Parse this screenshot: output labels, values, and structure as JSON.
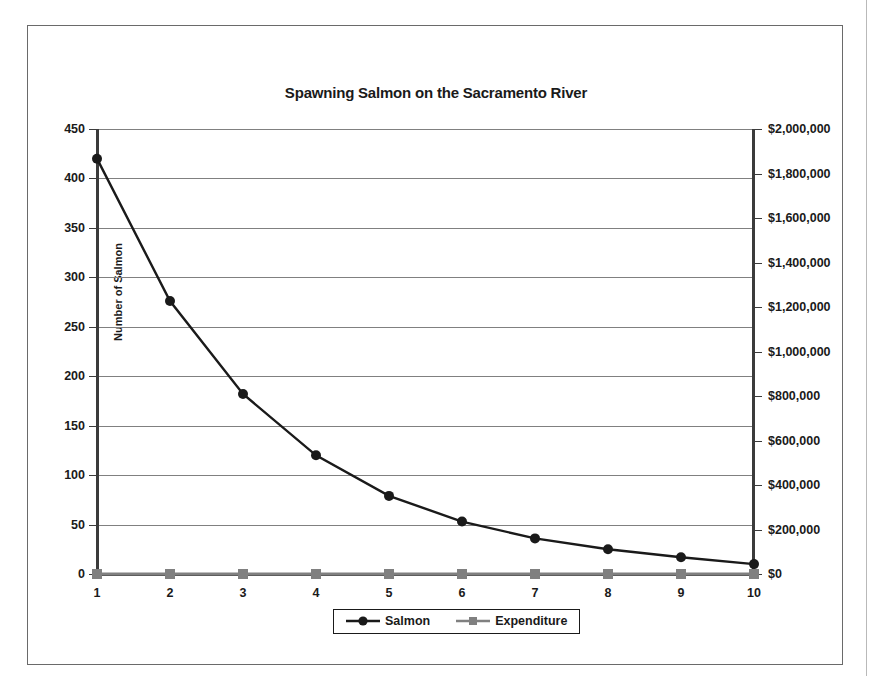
{
  "chart_data": {
    "type": "line",
    "title": "Spawning Salmon on the Sacramento River",
    "xlabel": "Year",
    "ylabel": "Number of Salmon",
    "y2label": "",
    "grid": true,
    "legend_position": "bottom",
    "categories": [
      "1",
      "2",
      "3",
      "4",
      "5",
      "6",
      "7",
      "8",
      "9",
      "10"
    ],
    "x": [
      1,
      2,
      3,
      4,
      5,
      6,
      7,
      8,
      9,
      10
    ],
    "ylim": [
      0,
      450
    ],
    "y2lim": [
      0,
      2000000
    ],
    "yticks": [
      "0",
      "50",
      "100",
      "150",
      "200",
      "250",
      "300",
      "350",
      "400",
      "450"
    ],
    "ytick_values": [
      0,
      50,
      100,
      150,
      200,
      250,
      300,
      350,
      400,
      450
    ],
    "y2ticks": [
      "$0",
      "$200,000",
      "$400,000",
      "$600,000",
      "$800,000",
      "$1,000,000",
      "$1,200,000",
      "$1,400,000",
      "$1,600,000",
      "$1,800,000",
      "$2,000,000"
    ],
    "y2tick_values": [
      0,
      200000,
      400000,
      600000,
      800000,
      1000000,
      1200000,
      1400000,
      1600000,
      1800000,
      2000000
    ],
    "series": [
      {
        "name": "Salmon",
        "axis": "left",
        "marker": "circle",
        "color": "#1a1a1a",
        "values": [
          420,
          276,
          182,
          120,
          79,
          53,
          36,
          25,
          17,
          10
        ]
      },
      {
        "name": "Expenditure",
        "axis": "right",
        "marker": "square",
        "color": "#808080",
        "values": [
          0,
          0,
          0,
          0,
          0,
          0,
          0,
          0,
          0,
          0
        ]
      }
    ]
  },
  "legend": {
    "items": [
      {
        "label": "Salmon"
      },
      {
        "label": "Expenditure"
      }
    ]
  },
  "colors": {
    "salmon_line": "#1a1a1a",
    "expenditure_line": "#808080",
    "gridline": "#808080",
    "axis": "#3b3b3b",
    "frame": "#6a6a6a",
    "text": "#1a1a1a",
    "background": "#ffffff"
  }
}
